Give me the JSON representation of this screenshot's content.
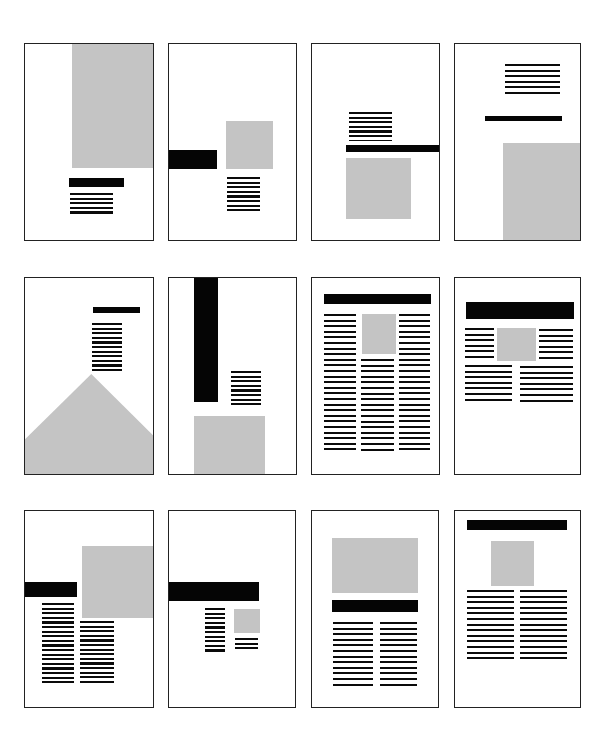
{
  "legend": {
    "black_bar": "headline",
    "gray_block": "image",
    "striped_block": "body text"
  },
  "colors": {
    "headline": "#050505",
    "image": "#c4c4c4",
    "text": "#0a0a0a",
    "frame": "#222222",
    "background": "#ffffff"
  },
  "layouts": [
    {
      "id": 1,
      "row": 1,
      "col": 1,
      "description": "large image top-right, headline and short text below"
    },
    {
      "id": 2,
      "row": 1,
      "col": 2,
      "description": "headline bleeding left, small image right, text below image"
    },
    {
      "id": 3,
      "row": 1,
      "col": 3,
      "description": "text above headline bleeding right, image below"
    },
    {
      "id": 4,
      "row": 1,
      "col": 4,
      "description": "text top, headline, image bleeding bottom-right"
    },
    {
      "id": 5,
      "row": 2,
      "col": 1,
      "description": "headline, narrow text, triangular image at bottom"
    },
    {
      "id": 6,
      "row": 2,
      "col": 2,
      "description": "vertical black bar from top, text, image bleeding bottom"
    },
    {
      "id": 7,
      "row": 2,
      "col": 3,
      "description": "headline across, three text columns with inset image"
    },
    {
      "id": 8,
      "row": 2,
      "col": 4,
      "description": "heavy headline, text wrapping around image, two columns"
    },
    {
      "id": 9,
      "row": 3,
      "col": 1,
      "description": "image bleeding right, headline bleeding left, two staggered text columns"
    },
    {
      "id": 10,
      "row": 3,
      "col": 2,
      "description": "headline bleeding left, small text column and small image with caption"
    },
    {
      "id": 11,
      "row": 3,
      "col": 3,
      "description": "wide image top, headline, two text columns"
    },
    {
      "id": 12,
      "row": 3,
      "col": 4,
      "description": "headline top, centered image, two text columns"
    }
  ]
}
